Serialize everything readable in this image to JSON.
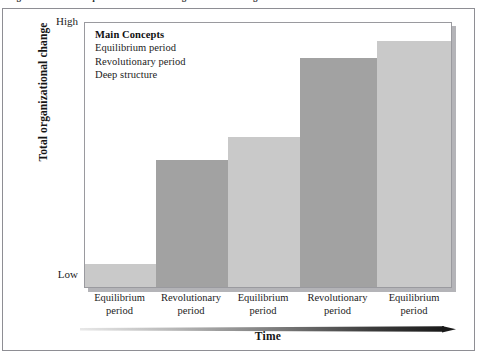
{
  "figure": {
    "caption_sliver": "Figure  Punctuated equilibrium model of organizational change",
    "border_color": "#8e8e94"
  },
  "legend": {
    "title": "Main Concepts",
    "items": [
      "Equilibrium period",
      "Revolutionary period",
      "Deep structure"
    ]
  },
  "axes": {
    "y_title": "Total organizational change",
    "y_high_label": "High",
    "y_low_label": "Low",
    "x_title": "Time"
  },
  "colors": {
    "bar_light": "#c9c9c9",
    "bar_dark": "#a2a2a2",
    "plot_border": "#9a9a9f",
    "plot_shadow": "#b4b4b8",
    "arrow_start": "#e2e2e2",
    "arrow_end": "#1e1e1e"
  },
  "chart_data": {
    "type": "bar",
    "title": "Punctuated equilibrium model of organizational change",
    "xlabel": "Time",
    "ylabel": "Total organizational change",
    "ylim": [
      0,
      100
    ],
    "ytick_labels": [
      "Low",
      "High"
    ],
    "grid": false,
    "legend": "inside-top-left",
    "categories": [
      "Equilibrium period",
      "Revolutionary period",
      "Equilibrium period",
      "Revolutionary period",
      "Equilibrium period"
    ],
    "category_lines": [
      [
        "Equilibrium",
        "period"
      ],
      [
        "Revolutionary",
        "period"
      ],
      [
        "Equilibrium",
        "period"
      ],
      [
        "Revolutionary",
        "period"
      ],
      [
        "Equilibrium",
        "period"
      ]
    ],
    "values": [
      9,
      48,
      57,
      87,
      93
    ],
    "bars": [
      {
        "label": "Equilibrium period",
        "period_type": "equilibrium",
        "value": 9,
        "color": "#c9c9c9",
        "left": 0,
        "width": 71,
        "top": 241
      },
      {
        "label": "Revolutionary period",
        "period_type": "revolutionary",
        "value": 48,
        "color": "#a2a2a2",
        "left": 71,
        "width": 72,
        "top": 137
      },
      {
        "label": "Equilibrium period",
        "period_type": "equilibrium",
        "value": 57,
        "color": "#c9c9c9",
        "left": 143,
        "width": 72,
        "top": 114
      },
      {
        "label": "Revolutionary period",
        "period_type": "revolutionary",
        "value": 87,
        "color": "#a2a2a2",
        "left": 215,
        "width": 77,
        "top": 35
      },
      {
        "label": "Equilibrium period",
        "period_type": "equilibrium",
        "value": 93,
        "color": "#c9c9c9",
        "left": 292,
        "width": 76,
        "top": 18
      }
    ],
    "x_label_positions": [
      0,
      71,
      143,
      215,
      292
    ],
    "x_label_widths": [
      71,
      72,
      72,
      77,
      76
    ]
  }
}
